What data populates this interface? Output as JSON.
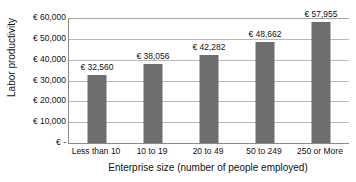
{
  "chart_data": {
    "type": "bar",
    "title": "",
    "xlabel": "Enterprise size (number of people employed)",
    "ylabel": "Labor productivity",
    "categories": [
      "Less than 10",
      "10 to 19",
      "20 to 49",
      "50 to 249",
      "250 or More"
    ],
    "values": [
      32560,
      38056,
      42282,
      48662,
      57955
    ],
    "value_labels": [
      "€ 32,560",
      "€ 38,056",
      "€ 42,282",
      "€ 48,662",
      "€ 57,955"
    ],
    "ylim": [
      0,
      60000
    ],
    "ytick_values": [
      60000,
      50000,
      40000,
      30000,
      20000,
      10000,
      0
    ],
    "ytick_labels": [
      "€ 60,000",
      "€ 50,000",
      "€ 40,000",
      "€ 30,000",
      "€ 20,000",
      "€ 10,000",
      "€ -"
    ],
    "grid": true,
    "legend": false,
    "legend_position": "none",
    "series": [
      {
        "name": "Labor productivity",
        "color": "#6e6e6e",
        "values": [
          32560,
          38056,
          42282,
          48662,
          57955
        ]
      }
    ],
    "colors": {
      "bar": "#6e6e6e",
      "gridline": "#b9b9b9",
      "axis": "#8a8a8a",
      "text": "#111111",
      "background": "#ffffff"
    }
  }
}
